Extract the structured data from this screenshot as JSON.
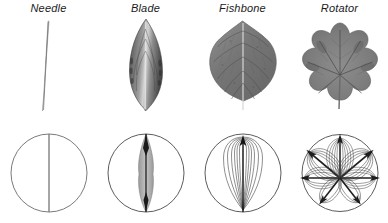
{
  "figure": {
    "background_color": "#ffffff",
    "label_style": "italic",
    "columns": [
      {
        "id": "needle",
        "label": "Needle",
        "photo": {
          "name": "needle-leaf-photo",
          "description": "Slender needle-shaped leaf, single thin line",
          "tone": "#8c8c8c"
        },
        "schema": {
          "name": "needle-schema",
          "description": "Circle with a single straight vertical midvein",
          "circle_color": "#6b6b6b",
          "vein_color": "#7a7a7a",
          "vein_count": 1,
          "arc_count": 0,
          "arrow_count": 0
        }
      },
      {
        "id": "blade",
        "label": "Blade",
        "photo": {
          "name": "blade-leaf-photo",
          "description": "Lanceolate blade leaf with parallel venation",
          "tone": "#6e6e6e"
        },
        "schema": {
          "name": "blade-schema",
          "description": "Circle with a narrow lens-shaped blade along vertical midvein",
          "circle_color": "#4a4a4a",
          "vein_color": "#2b2b2b",
          "vein_count": 1,
          "arc_count": 0,
          "arrow_count": 0
        }
      },
      {
        "id": "fishbone",
        "label": "Fishbone",
        "photo": {
          "name": "fishbone-leaf-photo",
          "description": "Ovate serrated leaf with pinnate fishbone venation",
          "tone": "#7a7a7a"
        },
        "schema": {
          "name": "fishbone-schema",
          "description": "Circle with one vertical arrow and nested loop arcs on both sides",
          "circle_color": "#4a4a4a",
          "vein_color": "#1f1f1f",
          "vein_count": 1,
          "arc_count": 12,
          "arrow_count": 1
        }
      },
      {
        "id": "rotator",
        "label": "Rotator",
        "photo": {
          "name": "rotator-leaf-photo",
          "description": "Palmate lobed leaf with radiating venation",
          "tone": "#787878"
        },
        "schema": {
          "name": "rotator-schema",
          "description": "Circle with seven radiating arrows each carrying nested loop arcs",
          "circle_color": "#4a4a4a",
          "vein_color": "#1f1f1f",
          "vein_count": 7,
          "arc_count": 60,
          "arrow_count": 7,
          "ray_angles_deg": [
            90,
            140,
            40,
            180,
            0,
            232,
            308
          ]
        }
      }
    ]
  }
}
